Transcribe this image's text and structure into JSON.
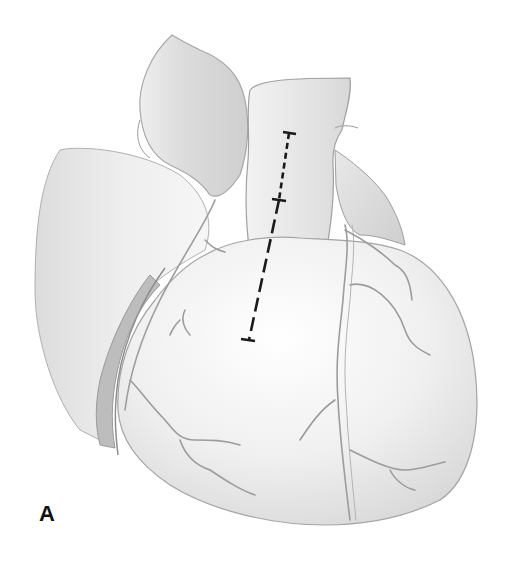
{
  "figure": {
    "panel_label": "A",
    "colors": {
      "background": "#ffffff",
      "tissue_light": "#f4f4f4",
      "tissue_mid": "#e2e2e2",
      "tissue_shadow": "#c8c8c8",
      "outline": "#a8a8a8",
      "vessel": "#9a9a9a",
      "incision_mark": "#1a1a1a"
    },
    "incision_line": {
      "short_dash_segment": {
        "from": [
          289,
          133
        ],
        "to": [
          279,
          200
        ]
      },
      "long_dash_segment": {
        "from": [
          279,
          200
        ],
        "to": [
          249,
          340
        ]
      }
    }
  }
}
